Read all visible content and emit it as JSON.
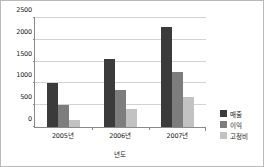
{
  "chart_data": {
    "type": "bar",
    "title": "",
    "xlabel": "년도",
    "ylabel": "",
    "ylim": [
      0,
      2500
    ],
    "ytick_labels": [
      "0",
      "500",
      "1000",
      "1500",
      "2000",
      "2500"
    ],
    "ytick_values": [
      0,
      500,
      1000,
      1500,
      2000,
      2500
    ],
    "grid": true,
    "legend_position": "right",
    "categories": [
      "2005년",
      "2006년",
      "2007년"
    ],
    "series": [
      {
        "name": "매출",
        "color": "#3b3b3b",
        "values": [
          1000,
          1550,
          2270
        ]
      },
      {
        "name": "이익",
        "color": "#7d7d7d",
        "values": [
          500,
          850,
          1240
        ]
      },
      {
        "name": "고정비",
        "color": "#c2c2c2",
        "values": [
          150,
          420,
          680
        ]
      }
    ]
  }
}
